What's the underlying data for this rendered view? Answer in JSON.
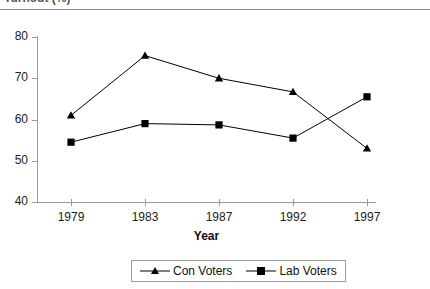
{
  "title": {
    "text": "Turnout (%)",
    "clipped": true
  },
  "axis": {
    "x_title": "Year",
    "y_ticks": [
      "80",
      "70",
      "60",
      "50",
      "40"
    ],
    "x_ticks": [
      "1979",
      "1983",
      "1987",
      "1992",
      "1997"
    ]
  },
  "legend": {
    "items": [
      {
        "label": "Con Voters",
        "marker": "triangle-marker",
        "color": "#000000"
      },
      {
        "label": "Lab Voters",
        "marker": "square-marker",
        "color": "#000000"
      }
    ]
  },
  "chart_data": {
    "type": "line",
    "title": "Turnout (%)",
    "xlabel": "Year",
    "ylabel": "",
    "categories": [
      "1979",
      "1983",
      "1987",
      "1992",
      "1997"
    ],
    "series": [
      {
        "name": "Con Voters",
        "marker": "triangle",
        "values": [
          61.0,
          75.5,
          70.0,
          66.7,
          53.0
        ]
      },
      {
        "name": "Lab Voters",
        "marker": "square",
        "values": [
          54.5,
          59.0,
          58.7,
          55.5,
          65.5
        ]
      }
    ],
    "ylim": [
      40,
      80
    ],
    "ytick_step": 10,
    "grid": false,
    "legend_position": "bottom"
  }
}
